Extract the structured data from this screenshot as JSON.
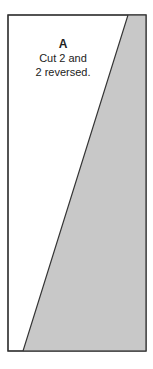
{
  "piece": {
    "letter": "A",
    "instruction_line1": "Cut 2 and",
    "instruction_line2": "2 reversed.",
    "fill_color": "#c8c8c8",
    "stroke_color": "#333333",
    "outline": {
      "x1": 8,
      "y1": 15,
      "x2": 146,
      "y2": 351
    },
    "diagonal": {
      "top_x": 128,
      "top_y": 15,
      "bottom_x": 23,
      "bottom_y": 351
    }
  }
}
